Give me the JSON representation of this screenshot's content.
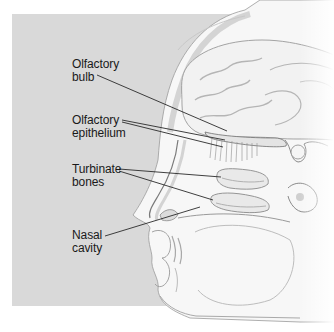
{
  "diagram": {
    "labels": [
      {
        "id": "olfactory-bulb",
        "line1": "Olfactory",
        "line2": "bulb",
        "x": 72,
        "y": 58
      },
      {
        "id": "olfactory-epithelium",
        "line1": "Olfactory",
        "line2": "epithelium",
        "x": 72,
        "y": 114
      },
      {
        "id": "turbinate-bones",
        "line1": "Turbinate",
        "line2": "bones",
        "x": 72,
        "y": 163
      },
      {
        "id": "nasal-cavity",
        "line1": "Nasal",
        "line2": "cavity",
        "x": 72,
        "y": 229
      }
    ],
    "colors": {
      "background_panel": "#d9d9d9",
      "tissue": "#f6f6f6",
      "outline": "#8a8a8a",
      "leader_line": "#2a2a2a",
      "text": "#1a1a1a"
    }
  }
}
